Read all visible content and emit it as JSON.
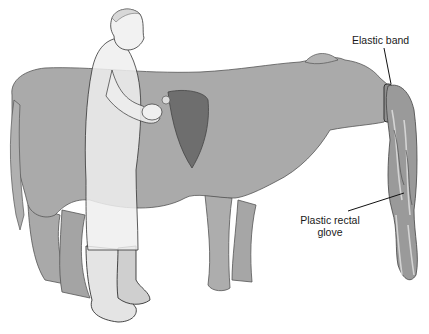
{
  "figure": {
    "labels": {
      "elastic_band": "Elastic band",
      "plastic_glove_line1": "Plastic rectal",
      "plastic_glove_line2": "glove"
    },
    "colors": {
      "cow_body": "#a9a9a9",
      "cow_outline": "#555555",
      "udder_dark": "#6e6e6e",
      "person_light": "#efefef",
      "leader_line": "#111111",
      "glove": "#9a9a9a"
    }
  }
}
